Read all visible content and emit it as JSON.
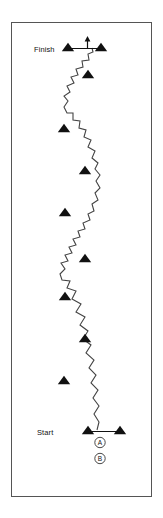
{
  "figure": {
    "title": "",
    "background_color": "#ffffff",
    "frame": {
      "stroke_color": "#555555",
      "x": 11,
      "y": 22,
      "width": 141,
      "height": 475
    }
  },
  "labels": {
    "finish": "Finish",
    "start": "Start"
  },
  "markers": [
    {
      "letter": "A"
    },
    {
      "letter": "B"
    }
  ],
  "chart_data": {
    "type": "line",
    "xlabel": "",
    "ylabel": "",
    "grid": false,
    "legend": "none",
    "path_style": "zigzag-wave",
    "path_color": "#444444",
    "gate_color": "#111111",
    "direction": "bottom-to-top",
    "xlim": [
      11,
      152
    ],
    "ylim": [
      22,
      497
    ],
    "series": [
      {
        "name": "course-path",
        "points": [
          [
            97,
            430
          ],
          [
            99,
            422
          ],
          [
            94,
            414
          ],
          [
            99,
            406
          ],
          [
            93,
            398
          ],
          [
            98,
            390
          ],
          [
            91,
            383
          ],
          [
            96,
            375
          ],
          [
            89,
            368
          ],
          [
            94,
            360
          ],
          [
            86,
            353
          ],
          [
            91,
            345
          ],
          [
            83,
            339
          ],
          [
            88,
            331
          ],
          [
            80,
            325
          ],
          [
            85,
            317
          ],
          [
            76,
            312
          ],
          [
            81,
            304
          ],
          [
            72,
            299
          ],
          [
            76,
            291
          ],
          [
            67,
            288
          ],
          [
            70,
            281
          ],
          [
            62,
            280
          ],
          [
            60,
            274
          ],
          [
            65,
            269
          ],
          [
            61,
            263
          ],
          [
            68,
            261
          ],
          [
            65,
            255
          ],
          [
            72,
            253
          ],
          [
            69,
            247
          ],
          [
            76,
            245
          ],
          [
            73,
            239
          ],
          [
            80,
            237
          ],
          [
            78,
            231
          ],
          [
            85,
            229
          ],
          [
            83,
            223
          ],
          [
            90,
            220
          ],
          [
            88,
            214
          ],
          [
            94,
            211
          ],
          [
            92,
            204
          ],
          [
            98,
            200
          ],
          [
            95,
            193
          ],
          [
            100,
            188
          ],
          [
            96,
            181
          ],
          [
            100,
            175
          ],
          [
            95,
            169
          ],
          [
            98,
            163
          ],
          [
            92,
            158
          ],
          [
            95,
            151
          ],
          [
            88,
            147
          ],
          [
            91,
            140
          ],
          [
            84,
            137
          ],
          [
            86,
            130
          ],
          [
            79,
            128
          ],
          [
            80,
            121
          ],
          [
            73,
            120
          ],
          [
            73,
            113
          ],
          [
            67,
            113
          ],
          [
            64,
            107
          ],
          [
            68,
            101
          ],
          [
            64,
            96
          ],
          [
            70,
            92
          ],
          [
            67,
            86
          ],
          [
            74,
            83
          ],
          [
            71,
            77
          ],
          [
            78,
            75
          ],
          [
            76,
            69
          ],
          [
            83,
            67
          ],
          [
            82,
            61
          ],
          [
            89,
            60
          ],
          [
            88,
            54
          ],
          [
            93,
            52
          ],
          [
            92,
            48
          ]
        ]
      }
    ],
    "gates": [
      {
        "name": "finish-gate-left",
        "x": 68,
        "y": 47,
        "type": "triangle"
      },
      {
        "name": "finish-gate-right",
        "x": 101,
        "y": 47,
        "type": "triangle"
      },
      {
        "name": "gate-1",
        "x": 88,
        "y": 74,
        "type": "triangle"
      },
      {
        "name": "gate-2",
        "x": 64,
        "y": 128,
        "type": "triangle"
      },
      {
        "name": "gate-3",
        "x": 85,
        "y": 170,
        "type": "triangle"
      },
      {
        "name": "gate-4",
        "x": 65,
        "y": 212,
        "type": "triangle"
      },
      {
        "name": "gate-5",
        "x": 85,
        "y": 258,
        "type": "triangle"
      },
      {
        "name": "gate-6",
        "x": 65,
        "y": 296,
        "type": "triangle"
      },
      {
        "name": "gate-7",
        "x": 85,
        "y": 338,
        "type": "triangle"
      },
      {
        "name": "gate-8",
        "x": 64,
        "y": 380,
        "type": "triangle"
      },
      {
        "name": "start-gate-left",
        "x": 88,
        "y": 430,
        "type": "triangle"
      },
      {
        "name": "start-gate-right",
        "x": 120,
        "y": 430,
        "type": "triangle"
      }
    ],
    "annotations": [
      {
        "name": "finish-label",
        "text": "Finish",
        "x": 35,
        "y": 50
      },
      {
        "name": "start-label",
        "text": "Start",
        "x": 38,
        "y": 433
      },
      {
        "name": "marker-a",
        "text": "A",
        "x": 100,
        "y": 445
      },
      {
        "name": "marker-b",
        "text": "B",
        "x": 100,
        "y": 461
      },
      {
        "name": "finish-arrow",
        "text": "",
        "x": 88,
        "y": 42
      }
    ]
  }
}
